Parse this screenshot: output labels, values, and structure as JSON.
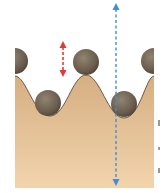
{
  "diagram": {
    "colors": {
      "background": "#ffffff",
      "sand_top": "#d9b38a",
      "sand_bottom": "#f1d3ab",
      "surface_line": "#5a4a3a",
      "ball": "#6b5d4d",
      "ball_highlight": "#8f8270",
      "red_arrow": "#e03a32",
      "blue_arrow": "#3f8fd6"
    },
    "balls": [
      {
        "name": "ball-left-peak-partial",
        "cx": 15,
        "cy": 60,
        "r": 13
      },
      {
        "name": "ball-center-peak",
        "cx": 86,
        "cy": 62,
        "r": 13
      },
      {
        "name": "ball-left-valley",
        "cx": 48,
        "cy": 103,
        "r": 13
      },
      {
        "name": "ball-right-valley",
        "cx": 124,
        "cy": 103,
        "r": 13
      },
      {
        "name": "ball-right-peak-partial",
        "cx": 154,
        "cy": 60,
        "r": 13
      }
    ],
    "arrows": [
      {
        "name": "red-double-arrow",
        "x": 63,
        "y1": 42,
        "y2": 76,
        "style": "dashed",
        "heads": "both"
      },
      {
        "name": "blue-double-arrow",
        "x": 116,
        "y1": 4,
        "y2": 184,
        "style": "dashed",
        "heads": "both"
      }
    ]
  }
}
